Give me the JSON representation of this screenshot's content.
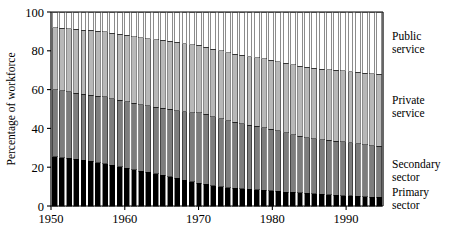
{
  "chart_data": {
    "type": "bar",
    "subtype": "stacked-bar-100-percent",
    "title": "",
    "subtitle": "",
    "xlabel": "",
    "ylabel": "Percentage of workforce",
    "ylim": [
      0,
      100
    ],
    "yticks": [
      0,
      20,
      40,
      60,
      80,
      100
    ],
    "ytick_labels": [
      "0",
      "20",
      "40",
      "60",
      "80",
      "100"
    ],
    "xlim": [
      1950,
      1995
    ],
    "xticks": [
      1950,
      1960,
      1970,
      1980,
      1990
    ],
    "xtick_labels": [
      "1950",
      "1960",
      "1970",
      "1980",
      "1990"
    ],
    "grid": false,
    "legend_position": "right-inline",
    "bar_edge_color": "#000000",
    "categories": [
      "1950",
      "1951",
      "1952",
      "1953",
      "1954",
      "1955",
      "1956",
      "1957",
      "1958",
      "1959",
      "1960",
      "1961",
      "1962",
      "1963",
      "1964",
      "1965",
      "1966",
      "1967",
      "1968",
      "1969",
      "1970",
      "1971",
      "1972",
      "1973",
      "1974",
      "1975",
      "1976",
      "1977",
      "1978",
      "1979",
      "1980",
      "1981",
      "1982",
      "1983",
      "1984",
      "1985",
      "1986",
      "1987",
      "1988",
      "1989",
      "1990",
      "1991",
      "1992",
      "1993",
      "1994",
      "1995"
    ],
    "series": [
      {
        "name": "Primary sector",
        "color": "#000000",
        "values": [
          25.5,
          25.0,
          24.5,
          24.0,
          23.5,
          23.0,
          22.3,
          21.8,
          21.0,
          20.3,
          19.5,
          18.7,
          18.0,
          17.3,
          16.5,
          15.8,
          15.0,
          14.2,
          13.3,
          12.5,
          11.8,
          11.2,
          10.5,
          10.0,
          9.5,
          9.2,
          9.0,
          8.7,
          8.4,
          8.1,
          7.8,
          7.5,
          7.2,
          7.0,
          6.8,
          6.5,
          6.2,
          6.0,
          5.8,
          5.6,
          5.4,
          5.2,
          5.0,
          4.8,
          4.6,
          4.5
        ]
      },
      {
        "name": "Secondary sector",
        "color": "#7d7d7d",
        "values": [
          34.5,
          34.4,
          34.3,
          34.2,
          34.1,
          34.2,
          34.3,
          34.4,
          34.3,
          34.2,
          34.2,
          34.2,
          34.3,
          34.4,
          34.5,
          34.7,
          34.9,
          35.0,
          35.2,
          35.6,
          36.2,
          36.0,
          35.5,
          35.0,
          34.5,
          34.0,
          33.5,
          33.0,
          32.6,
          32.2,
          31.7,
          31.2,
          30.5,
          29.8,
          29.2,
          28.8,
          28.5,
          28.2,
          28.0,
          27.8,
          27.6,
          27.4,
          27.1,
          26.8,
          26.5,
          26.3
        ]
      },
      {
        "name": "Private service",
        "color": "#b8b8b8",
        "values": [
          32.0,
          32.3,
          32.5,
          32.8,
          33.1,
          33.3,
          33.5,
          33.6,
          33.8,
          34.0,
          34.2,
          34.4,
          34.5,
          34.6,
          34.8,
          34.9,
          35.0,
          35.1,
          35.2,
          35.0,
          34.8,
          34.7,
          34.8,
          34.9,
          35.0,
          35.1,
          35.2,
          35.3,
          35.4,
          35.5,
          35.6,
          35.7,
          35.8,
          35.9,
          36.0,
          36.1,
          36.2,
          36.3,
          36.4,
          36.5,
          36.6,
          36.7,
          36.8,
          36.9,
          37.0,
          37.0
        ]
      },
      {
        "name": "Public service",
        "color": "#ffffff",
        "values": [
          8.0,
          8.3,
          8.7,
          9.0,
          9.3,
          9.5,
          9.9,
          10.2,
          10.9,
          11.5,
          12.1,
          12.7,
          13.2,
          13.7,
          14.2,
          14.6,
          15.1,
          15.7,
          16.3,
          16.9,
          17.2,
          18.1,
          19.2,
          20.1,
          21.0,
          21.7,
          22.3,
          23.0,
          23.6,
          24.2,
          24.9,
          25.6,
          26.5,
          27.3,
          28.0,
          28.6,
          29.1,
          29.5,
          29.8,
          30.1,
          30.4,
          30.7,
          31.1,
          31.5,
          31.9,
          32.2
        ]
      }
    ]
  },
  "legend": {
    "entries": [
      {
        "line1": "Public",
        "line2": "service"
      },
      {
        "line1": "Private",
        "line2": "service"
      },
      {
        "line1": "Secondary",
        "line2": "sector"
      },
      {
        "line1": "Primary",
        "line2": "sector"
      }
    ]
  }
}
